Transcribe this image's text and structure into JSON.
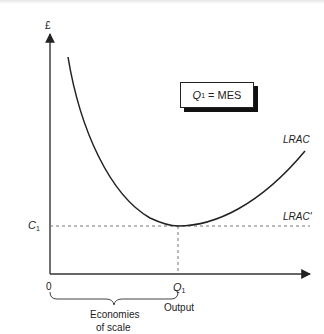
{
  "diagram": {
    "type": "economics-cost-curve",
    "y_axis_label": "£",
    "x_axis_label": "Output",
    "origin_label": "0",
    "q1_label": "Q",
    "q1_sub": "1",
    "c1_label": "C",
    "c1_sub": "1",
    "mes_box": {
      "q": "Q",
      "sub": "1",
      "text": " = MES"
    },
    "curve_label": "LRAC",
    "flat_label": "LRAC'",
    "brace_label_line1": "Economies",
    "brace_label_line2": "of scale",
    "colors": {
      "line": "#222222",
      "dashed": "#777777",
      "background": "#ffffff"
    }
  }
}
